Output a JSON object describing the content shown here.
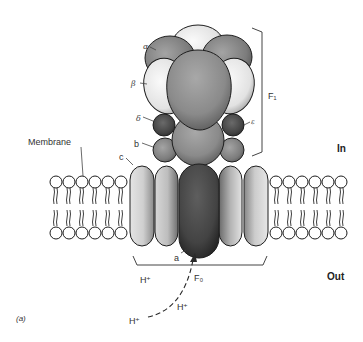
{
  "figure": {
    "panel_label": "(a)"
  },
  "labels": {
    "membrane": "Membrane",
    "in": "In",
    "out": "Out",
    "f1": "F₁",
    "f0": "F₀",
    "alpha": "α",
    "beta": "β",
    "delta": "δ",
    "epsilon": "ε",
    "b": "b",
    "c": "c",
    "a": "a",
    "proton_1": "H⁺",
    "proton_2": "H⁺",
    "proton_3": "H⁺"
  },
  "colors": {
    "background": "#ffffff",
    "line": "#1e1e1e",
    "subunit_a": "#4a4a4a",
    "subunit_alpha": "#7a7a7a",
    "subunit_beta": "#e8e8e8",
    "subunit_gamma": "#8c8c8c",
    "subunit_c_light": "#d6d6d6",
    "subunit_c_mid": "#bdbdbd",
    "subunit_small": "#6e6e6e",
    "lipid_head": "#ffffff"
  }
}
